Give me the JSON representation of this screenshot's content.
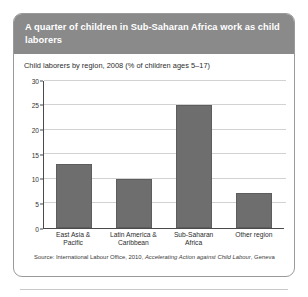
{
  "card": {
    "title": "A quarter of children in Sub-Saharan Africa work as child laborers",
    "subtitle": "Child laborers by region, 2008 (% of children ages 5–17)",
    "source_prefix": "Source: International Labour Office, 2010, ",
    "source_title": "Accelerating Action against Child Labour",
    "source_suffix": ", Geneva"
  },
  "colors": {
    "header_background": "#8a8a8a",
    "header_text": "#ffffff",
    "bar_fill": "#6e6e6e",
    "gridline": "#d2d2d2",
    "axis": "#4a4a4a",
    "card_border": "#9a9a9a"
  },
  "chart_data": {
    "type": "bar",
    "title": "Child laborers by region, 2008 (% of children ages 5–17)",
    "categories": [
      "East Asia & Pacific",
      "Latin America & Caribbean",
      "Sub-Saharan Africa",
      "Other region"
    ],
    "category_lines": [
      [
        "East Asia &",
        "Pacific"
      ],
      [
        "Latin America &",
        "Caribbean"
      ],
      [
        "Sub-Saharan",
        "Africa"
      ],
      [
        "Other region"
      ]
    ],
    "values": [
      13,
      10,
      25,
      7
    ],
    "xlabel": "",
    "ylabel": "",
    "ylim": [
      0,
      30
    ],
    "yticks": [
      0,
      5,
      10,
      15,
      20,
      25,
      30
    ],
    "grid": "horizontal",
    "legend": "none"
  }
}
